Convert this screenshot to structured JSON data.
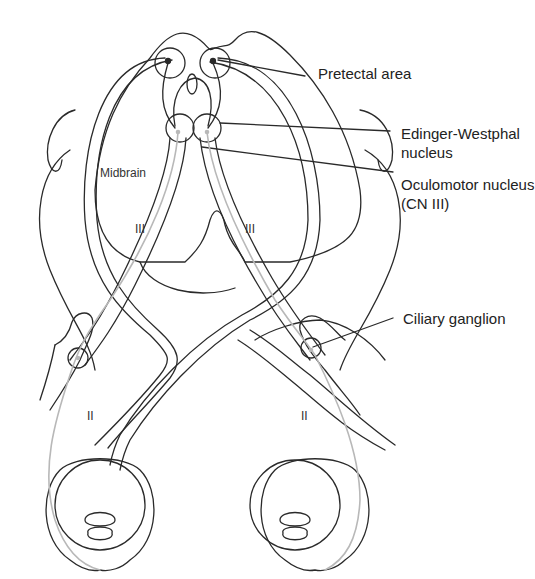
{
  "diagram": {
    "labels": {
      "pretectal_area": "Pretectal area",
      "edinger_westphal_line1": "Edinger-Westphal",
      "edinger_westphal_line2": "nucleus",
      "oculomotor_line1": "Oculomotor nucleus",
      "oculomotor_line2": "(CN III)",
      "midbrain": "Midbrain",
      "ciliary_ganglion": "Ciliary ganglion",
      "cn3_left": "III",
      "cn3_right": "III",
      "cn2_left": "II",
      "cn2_right": "II"
    },
    "colors": {
      "outline": "#2a2a2a",
      "parasympathetic_fiber": "#b8b8b8",
      "background": "#ffffff",
      "text": "#222222"
    }
  }
}
